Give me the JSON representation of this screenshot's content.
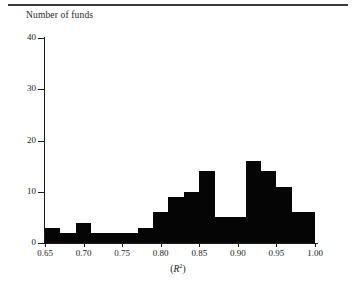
{
  "figure": {
    "has_top_rule": true,
    "background_color": "#ffffff",
    "bar_color": "#050505",
    "axis_color": "#1a1a1a"
  },
  "axis_titles": {
    "y": "Number of funds",
    "x_prefix": "(",
    "x_symbol": "R",
    "x_superscript": "2",
    "x_suffix": ")"
  },
  "chart_data": {
    "type": "bar",
    "title": "",
    "subtitle": "",
    "xlabel": "(R2)",
    "ylabel": "Number of funds",
    "xlim": [
      0.65,
      1.0
    ],
    "ylim": [
      0,
      40
    ],
    "grid": false,
    "legend": false,
    "bin_width": 0.02,
    "x_ticks": [
      0.65,
      0.7,
      0.75,
      0.8,
      0.85,
      0.9,
      0.95,
      1.0
    ],
    "x_tick_labels": [
      "0.65",
      "0.70",
      "0.75",
      "0.80",
      "0.85",
      "0.90",
      "0.95",
      "1.00"
    ],
    "y_ticks": [
      0,
      10,
      20,
      30,
      40
    ],
    "y_tick_labels": [
      "0",
      "10",
      "20",
      "30",
      "40"
    ],
    "bins": [
      {
        "x0": 0.65,
        "x1": 0.67,
        "value": 3
      },
      {
        "x0": 0.67,
        "x1": 0.69,
        "value": 2
      },
      {
        "x0": 0.69,
        "x1": 0.71,
        "value": 4
      },
      {
        "x0": 0.71,
        "x1": 0.73,
        "value": 2
      },
      {
        "x0": 0.73,
        "x1": 0.75,
        "value": 2
      },
      {
        "x0": 0.75,
        "x1": 0.77,
        "value": 2
      },
      {
        "x0": 0.77,
        "x1": 0.79,
        "value": 3
      },
      {
        "x0": 0.79,
        "x1": 0.81,
        "value": 6
      },
      {
        "x0": 0.81,
        "x1": 0.83,
        "value": 9
      },
      {
        "x0": 0.83,
        "x1": 0.85,
        "value": 10
      },
      {
        "x0": 0.85,
        "x1": 0.87,
        "value": 14
      },
      {
        "x0": 0.87,
        "x1": 0.89,
        "value": 5
      },
      {
        "x0": 0.89,
        "x1": 0.91,
        "value": 5
      },
      {
        "x0": 0.91,
        "x1": 0.93,
        "value": 16
      },
      {
        "x0": 0.93,
        "x1": 0.95,
        "value": 14
      },
      {
        "x0": 0.95,
        "x1": 0.97,
        "value": 11
      },
      {
        "x0": 0.97,
        "x1": 0.99,
        "value": 6
      },
      {
        "x0": 0.99,
        "x1": 1.0,
        "value": 6
      }
    ],
    "categories": [
      "0.65-0.67",
      "0.67-0.69",
      "0.69-0.71",
      "0.71-0.73",
      "0.73-0.75",
      "0.75-0.77",
      "0.77-0.79",
      "0.79-0.81",
      "0.81-0.83",
      "0.83-0.85",
      "0.85-0.87",
      "0.87-0.89",
      "0.89-0.91",
      "0.91-0.93",
      "0.93-0.95",
      "0.95-0.97",
      "0.97-0.99",
      "0.99-1.00"
    ],
    "values": [
      3,
      2,
      4,
      2,
      2,
      2,
      3,
      6,
      9,
      10,
      14,
      5,
      5,
      16,
      14,
      11,
      6,
      6
    ]
  }
}
